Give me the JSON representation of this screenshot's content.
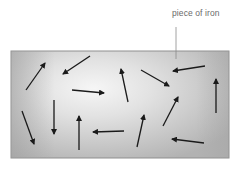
{
  "diagram": {
    "label": "piece of iron",
    "colors": {
      "arrow": "#1a1a1a",
      "leader_line": "#8a8a8a",
      "block_border": "#8f8f8f",
      "gradient_dark": "#a8a8a8",
      "gradient_light": "#f4f4f4",
      "gradient_right": "#bdbdbd",
      "label": "#6a6a6a"
    },
    "block": {
      "x": 11,
      "y": 51,
      "width": 218,
      "height": 107
    },
    "leader": {
      "x": 176,
      "y1": 27,
      "y2": 59
    },
    "arrows": [
      {
        "name": "domain-arrow-1",
        "direction": "up-right",
        "x1": 26,
        "y1": 90,
        "x2": 45,
        "y2": 63
      },
      {
        "name": "domain-arrow-2",
        "direction": "down-left",
        "x1": 90,
        "y1": 56,
        "x2": 63,
        "y2": 74
      },
      {
        "name": "domain-arrow-3",
        "direction": "right",
        "x1": 72,
        "y1": 90,
        "x2": 104,
        "y2": 93
      },
      {
        "name": "domain-arrow-4",
        "direction": "down",
        "x1": 54,
        "y1": 100,
        "x2": 54,
        "y2": 134
      },
      {
        "name": "domain-arrow-5",
        "direction": "down",
        "x1": 22,
        "y1": 111,
        "x2": 34,
        "y2": 144
      },
      {
        "name": "domain-arrow-6",
        "direction": "up",
        "x1": 79,
        "y1": 150,
        "x2": 79,
        "y2": 116
      },
      {
        "name": "domain-arrow-7",
        "direction": "left",
        "x1": 124,
        "y1": 131,
        "x2": 93,
        "y2": 132
      },
      {
        "name": "domain-arrow-8",
        "direction": "up",
        "x1": 128,
        "y1": 102,
        "x2": 121,
        "y2": 69
      },
      {
        "name": "domain-arrow-9",
        "direction": "down-right",
        "x1": 141,
        "y1": 70,
        "x2": 169,
        "y2": 86
      },
      {
        "name": "domain-arrow-10",
        "direction": "left",
        "x1": 205,
        "y1": 66,
        "x2": 173,
        "y2": 71
      },
      {
        "name": "domain-arrow-11",
        "direction": "up",
        "x1": 216,
        "y1": 113,
        "x2": 216,
        "y2": 79
      },
      {
        "name": "domain-arrow-12",
        "direction": "up-right",
        "x1": 163,
        "y1": 126,
        "x2": 178,
        "y2": 97
      },
      {
        "name": "domain-arrow-13",
        "direction": "up",
        "x1": 137,
        "y1": 147,
        "x2": 144,
        "y2": 115
      },
      {
        "name": "domain-arrow-14",
        "direction": "left",
        "x1": 204,
        "y1": 143,
        "x2": 172,
        "y2": 139
      }
    ]
  }
}
